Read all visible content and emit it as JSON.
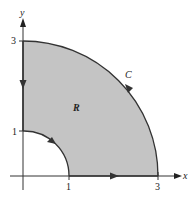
{
  "diagram": {
    "axes": {
      "x_label": "x",
      "y_label": "y",
      "x_ticks": [
        "1",
        "3"
      ],
      "y_ticks": [
        "1",
        "3"
      ]
    },
    "region_label": "R",
    "curve_label": "C",
    "colors": {
      "region_fill": "#c4c4c4",
      "stroke": "#333333",
      "background": "#ffffff"
    }
  }
}
